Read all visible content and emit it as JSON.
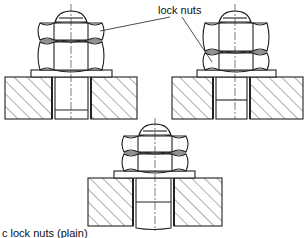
{
  "diagram": {
    "label_top": "lock nuts",
    "caption": "c  lock nuts (plain)",
    "figures": [
      {
        "id": "fig-a",
        "description": "thin lock nut above thick nut",
        "cx": 71,
        "top_nut": "thin",
        "bottom_nut": "thick"
      },
      {
        "id": "fig-b",
        "description": "thick nut above thin lock nut",
        "cx": 231,
        "top_nut": "thick",
        "bottom_nut": "thin"
      },
      {
        "id": "fig-c",
        "description": "two plain nuts of equal thickness",
        "cx": 155,
        "top_nut": "equal",
        "bottom_nut": "equal"
      }
    ],
    "colors": {
      "line": "#222222",
      "background": "#ffffff"
    }
  }
}
